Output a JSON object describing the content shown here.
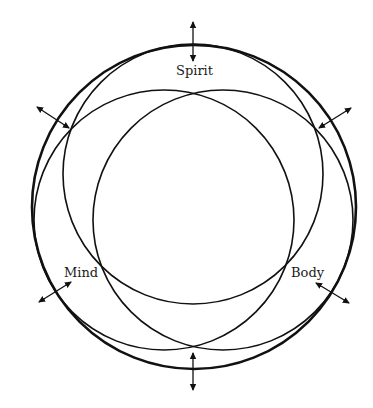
{
  "diagram": {
    "labels": {
      "spirit": "Spirit",
      "mind": "Mind",
      "body": "Body"
    },
    "colors": {
      "stroke": "#111111",
      "background": "#ffffff"
    },
    "elements": {
      "outer_circle": "whole",
      "inner_circles": [
        "spirit",
        "mind",
        "body"
      ],
      "arrows": [
        "top",
        "upper-left",
        "upper-right",
        "lower-left",
        "lower-right",
        "bottom"
      ]
    }
  }
}
